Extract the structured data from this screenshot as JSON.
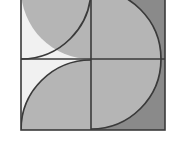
{
  "figure": {
    "type": "geometric-diagram",
    "canvas": {
      "width": 171,
      "height": 158,
      "background": "#ffffff"
    },
    "square": {
      "left": 21,
      "top": -11,
      "right": 165,
      "bottom": 130,
      "width": 144,
      "height": 141,
      "stroke": "#3a3a3a",
      "stroke_width": 1.6
    },
    "dividers": {
      "vertical_x": 91,
      "horizontal_y": 59,
      "stroke": "#3a3a3a",
      "stroke_width": 1.6
    },
    "palette": {
      "very_light": "#f1f1f1",
      "light_gray": "#d9d9d9",
      "medium_gray": "#b5b5b5",
      "dark_gray": "#8a8a8a",
      "outline": "#3a3a3a"
    },
    "regions": [
      {
        "name": "top-left-quadrant",
        "fill": "#f1f1f1",
        "description": "upper left quadrant background, very light gray"
      },
      {
        "name": "bottom-left-quadrant",
        "fill": "#f1f1f1",
        "description": "lower left quadrant background, very light gray"
      },
      {
        "name": "top-left-quarter-circle",
        "fill": "#b5b5b5",
        "center_x": 91,
        "center_y": -11,
        "radius": 70,
        "description": "quarter disc anchored at top-right corner of upper-left quadrant"
      },
      {
        "name": "bottom-left-quarter-circle",
        "fill": "#b5b5b5",
        "center_x": 91,
        "center_y": 130,
        "radius": 70,
        "description": "quarter disc anchored at bottom-right corner of lower-left quadrant"
      },
      {
        "name": "right-half-background",
        "fill": "#8a8a8a",
        "description": "right half of square, dark gray"
      },
      {
        "name": "right-semicircle",
        "fill": "#b5b5b5",
        "center_x": 91,
        "center_y": 59,
        "radius": 70,
        "description": "large semicircle bulging rightward from vertical divider"
      }
    ]
  }
}
